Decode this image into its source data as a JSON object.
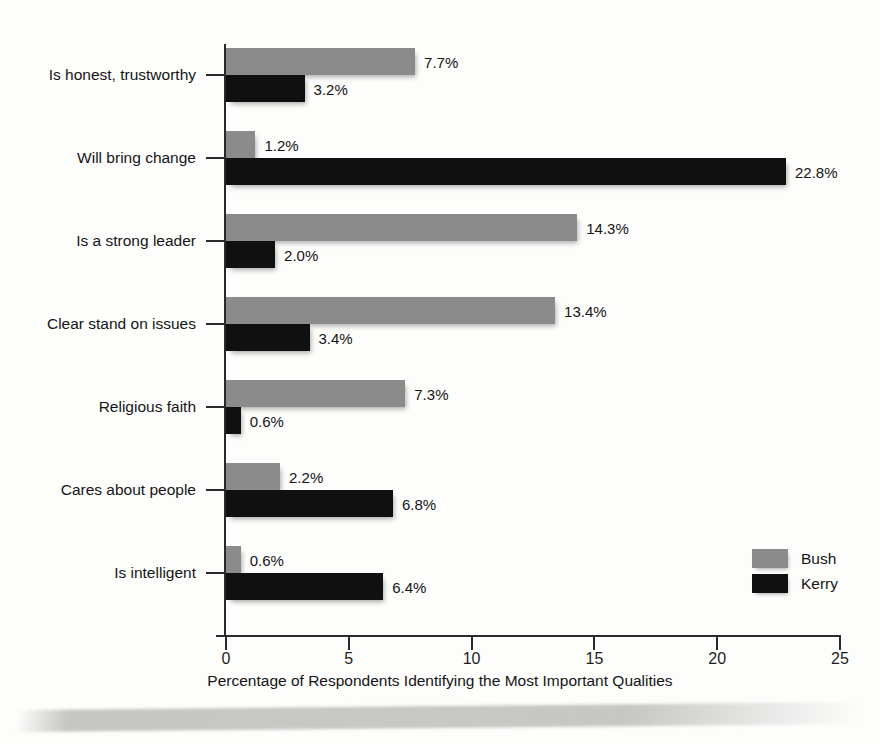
{
  "chart_data": {
    "type": "bar",
    "orientation": "horizontal",
    "title": "",
    "xlabel": "Percentage of Respondents Identifying the Most Important Qualities",
    "ylabel": "",
    "xlim": [
      0,
      25
    ],
    "xticks": [
      0,
      5,
      10,
      15,
      20,
      25
    ],
    "xtick_labels": [
      "0",
      "5",
      "10",
      "15",
      "20",
      "25"
    ],
    "grid": false,
    "legend_position": "right-inside-lower",
    "value_label_suffix": "%",
    "categories": [
      "Is honest, trustworthy",
      "Will bring change",
      "Is a strong leader",
      "Clear stand on issues",
      "Religious faith",
      "Cares about people",
      "Is intelligent"
    ],
    "series": [
      {
        "name": "Bush",
        "color": "#8b8b8b",
        "values": [
          7.7,
          1.2,
          14.3,
          13.4,
          7.3,
          2.2,
          0.6
        ],
        "value_labels": [
          "7.7%",
          "1.2%",
          "14.3%",
          "13.4%",
          "7.3%",
          "2.2%",
          "0.6%"
        ]
      },
      {
        "name": "Kerry",
        "color": "#101010",
        "values": [
          3.2,
          22.8,
          2.0,
          3.4,
          0.6,
          6.8,
          6.4
        ],
        "value_labels": [
          "3.2%",
          "22.8%",
          "2.0%",
          "3.4%",
          "0.6%",
          "6.8%",
          "6.4%"
        ]
      }
    ]
  },
  "legend": {
    "entries": [
      {
        "label": "Bush",
        "color": "#8b8b8b"
      },
      {
        "label": "Kerry",
        "color": "#101010"
      }
    ]
  }
}
